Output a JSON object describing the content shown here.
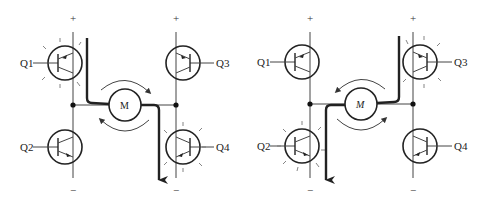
{
  "figure": {
    "panels": [
      {
        "id": "left",
        "supply_positive": "+",
        "supply_negative": "−",
        "motor_label": "M",
        "transistors": [
          {
            "label": "Q1",
            "active": true
          },
          {
            "label": "Q2",
            "active": false
          },
          {
            "label": "Q3",
            "active": false
          },
          {
            "label": "Q4",
            "active": true
          }
        ],
        "current_path": "Q1 → M → Q4",
        "rotation": "clockwise"
      },
      {
        "id": "right",
        "supply_positive": "+",
        "supply_negative": "−",
        "motor_label": "M",
        "transistors": [
          {
            "label": "Q1",
            "active": false
          },
          {
            "label": "Q2",
            "active": true
          },
          {
            "label": "Q3",
            "active": true
          },
          {
            "label": "Q4",
            "active": false
          }
        ],
        "current_path": "Q3 → M → Q2",
        "rotation": "counterclockwise"
      }
    ],
    "colors": {
      "line": "#222222",
      "background": "#ffffff"
    }
  }
}
